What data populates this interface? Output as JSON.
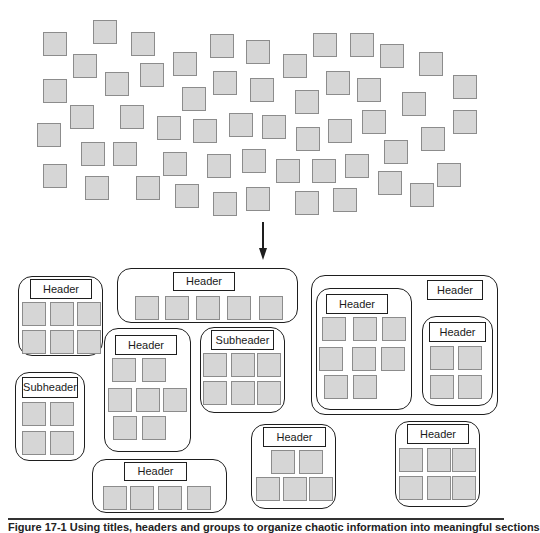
{
  "scattered_items": [
    [
      43,
      32
    ],
    [
      93,
      20
    ],
    [
      131,
      32
    ],
    [
      210,
      34
    ],
    [
      246,
      40
    ],
    [
      283,
      54
    ],
    [
      313,
      33
    ],
    [
      350,
      33
    ],
    [
      380,
      44
    ],
    [
      419,
      52
    ],
    [
      73,
      54
    ],
    [
      105,
      72
    ],
    [
      140,
      63
    ],
    [
      173,
      52
    ],
    [
      213,
      71
    ],
    [
      250,
      78
    ],
    [
      295,
      90
    ],
    [
      326,
      71
    ],
    [
      357,
      78
    ],
    [
      402,
      92
    ],
    [
      453,
      75
    ],
    [
      43,
      79
    ],
    [
      70,
      105
    ],
    [
      120,
      105
    ],
    [
      157,
      116
    ],
    [
      182,
      87
    ],
    [
      193,
      119
    ],
    [
      229,
      113
    ],
    [
      262,
      115
    ],
    [
      296,
      127
    ],
    [
      328,
      119
    ],
    [
      362,
      110
    ],
    [
      421,
      127
    ],
    [
      453,
      110
    ],
    [
      37,
      123
    ],
    [
      81,
      142
    ],
    [
      113,
      142
    ],
    [
      163,
      152
    ],
    [
      207,
      154
    ],
    [
      242,
      149
    ],
    [
      276,
      159
    ],
    [
      312,
      159
    ],
    [
      345,
      154
    ],
    [
      384,
      140
    ],
    [
      437,
      163
    ],
    [
      43,
      164
    ],
    [
      85,
      176
    ],
    [
      136,
      176
    ],
    [
      175,
      184
    ],
    [
      213,
      192
    ],
    [
      246,
      187
    ],
    [
      295,
      191
    ],
    [
      333,
      188
    ],
    [
      378,
      171
    ],
    [
      410,
      183
    ]
  ],
  "arrow": {
    "x": 263,
    "y1": 222,
    "y2": 260
  },
  "groups": [
    {
      "id": "header-left",
      "box": [
        18,
        276,
        85,
        80
      ],
      "label": {
        "text": "Header",
        "rect": [
          30,
          279,
          62,
          20
        ]
      },
      "items": [
        [
          22,
          302
        ],
        [
          50,
          302
        ],
        [
          77,
          302
        ],
        [
          22,
          330
        ],
        [
          50,
          330
        ],
        [
          77,
          330
        ]
      ]
    },
    {
      "id": "header-top-wide",
      "box": [
        117,
        268,
        181,
        55
      ],
      "label": {
        "text": "Header",
        "rect": [
          173,
          272,
          62,
          19
        ]
      },
      "items": [
        [
          135,
          296
        ],
        [
          165,
          296
        ],
        [
          196,
          296
        ],
        [
          227,
          296
        ],
        [
          259,
          296
        ]
      ]
    },
    {
      "id": "header-middle",
      "box": [
        104,
        328,
        87,
        124
      ],
      "label": {
        "text": "Header",
        "rect": [
          115,
          335,
          62,
          20
        ]
      },
      "items": [
        [
          112,
          358
        ],
        [
          142,
          358
        ],
        [
          108,
          388
        ],
        [
          136,
          388
        ],
        [
          163,
          388
        ],
        [
          113,
          416
        ],
        [
          142,
          416
        ]
      ]
    },
    {
      "id": "subheader-middle",
      "box": [
        200,
        327,
        85,
        86
      ],
      "label": {
        "text": "Subheader",
        "rect": [
          211,
          330,
          63,
          20
        ]
      },
      "items": [
        [
          203,
          353
        ],
        [
          231,
          353
        ],
        [
          257,
          353
        ],
        [
          203,
          381
        ],
        [
          231,
          381
        ],
        [
          257,
          381
        ]
      ]
    },
    {
      "id": "subheader-left",
      "box": [
        15,
        372,
        70,
        89
      ],
      "label": {
        "text": "Subheader",
        "rect": [
          22,
          377,
          56,
          21
        ]
      },
      "items": [
        [
          22,
          402
        ],
        [
          50,
          402
        ],
        [
          22,
          431
        ],
        [
          50,
          431
        ]
      ]
    },
    {
      "id": "header-bottom-wide",
      "box": [
        92,
        459,
        135,
        54
      ],
      "label": {
        "text": "Header",
        "rect": [
          124,
          462,
          63,
          19
        ]
      },
      "items": [
        [
          103,
          486
        ],
        [
          130,
          486
        ],
        [
          158,
          486
        ],
        [
          187,
          486
        ]
      ]
    },
    {
      "id": "header-bottom-center",
      "box": [
        251,
        424,
        85,
        85
      ],
      "label": {
        "text": "Header",
        "rect": [
          263,
          427,
          63,
          20
        ]
      },
      "items": [
        [
          271,
          450
        ],
        [
          299,
          450
        ],
        [
          256,
          477
        ],
        [
          283,
          477
        ],
        [
          309,
          477
        ]
      ]
    },
    {
      "id": "header-bottom-right",
      "box": [
        395,
        421,
        85,
        86
      ],
      "label": {
        "text": "Header",
        "rect": [
          407,
          424,
          62,
          20
        ]
      },
      "items": [
        [
          399,
          448
        ],
        [
          427,
          448
        ],
        [
          452,
          448
        ],
        [
          399,
          476
        ],
        [
          427,
          476
        ],
        [
          452,
          476
        ]
      ]
    },
    {
      "id": "header-outer-right",
      "box": [
        311,
        275,
        187,
        140
      ],
      "label": {
        "text": "Header",
        "rect": [
          427,
          280,
          56,
          20
        ]
      },
      "items": []
    },
    {
      "id": "header-inner-left",
      "box": [
        316,
        288,
        96,
        122
      ],
      "label": {
        "text": "Header",
        "rect": [
          326,
          294,
          62,
          20
        ]
      },
      "items": [
        [
          322,
          317
        ],
        [
          353,
          317
        ],
        [
          382,
          317
        ],
        [
          319,
          347
        ],
        [
          352,
          347
        ],
        [
          381,
          347
        ],
        [
          324,
          375
        ],
        [
          353,
          375
        ]
      ]
    },
    {
      "id": "header-inner-right",
      "box": [
        422,
        316,
        71,
        90
      ],
      "label": {
        "text": "Header",
        "rect": [
          429,
          322,
          57,
          20
        ]
      },
      "items": [
        [
          430,
          346
        ],
        [
          458,
          346
        ],
        [
          430,
          375
        ],
        [
          458,
          375
        ]
      ]
    }
  ],
  "rule": {
    "x": 8,
    "y": 518,
    "w": 496
  },
  "caption": {
    "text": "Figure 17-1  Using titles, headers and groups to organize chaotic information into meaningful sections",
    "x": 8,
    "y": 521
  }
}
